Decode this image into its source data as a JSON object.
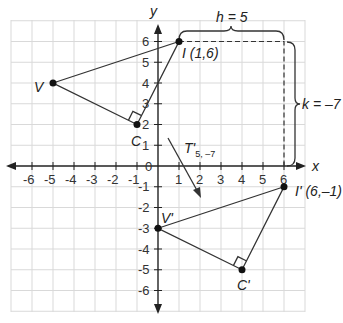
{
  "axes": {
    "x_label": "x",
    "y_label": "y",
    "origin_label": "0",
    "x_ticks": [
      "-6",
      "-5",
      "-4",
      "-3",
      "-2",
      "-1",
      "1",
      "2",
      "3",
      "4",
      "5",
      "6"
    ],
    "y_ticks_pos": [
      "1",
      "2",
      "3",
      "4",
      "5",
      "6"
    ],
    "y_ticks_neg": [
      "-1",
      "-2",
      "-3",
      "-4",
      "-5",
      "-6"
    ],
    "x_range": [
      -7,
      7
    ],
    "y_range": [
      -7,
      7
    ]
  },
  "original_triangle": {
    "vertices": [
      {
        "name": "V",
        "x": -5,
        "y": 4,
        "label": "V"
      },
      {
        "name": "I",
        "x": 1,
        "y": 6,
        "label": "I (1,6)"
      },
      {
        "name": "C",
        "x": -1,
        "y": 2,
        "label": "C"
      }
    ],
    "right_angle_at": "C"
  },
  "image_triangle": {
    "vertices": [
      {
        "name": "V'",
        "x": 0,
        "y": -3,
        "label": "V'"
      },
      {
        "name": "I'",
        "x": 6,
        "y": -1,
        "label": "I' (6,–1)"
      },
      {
        "name": "C'",
        "x": 4,
        "y": -5,
        "label": "C'"
      }
    ],
    "right_angle_at": "C'"
  },
  "translation": {
    "label_main": "T'",
    "label_sub": "5, –7",
    "h_label": "h = 5",
    "k_label": "k = –7"
  },
  "colors": {
    "line": "#333333",
    "grid": "#d9d9d9",
    "point": "#111111"
  }
}
